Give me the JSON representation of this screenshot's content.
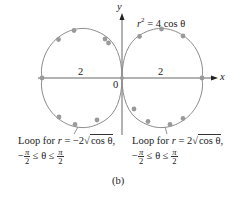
{
  "figure": {
    "caption": "(b)",
    "equation": {
      "lhs_var": "r",
      "exponent": "2",
      "rhs": "= 4 cos θ"
    },
    "axes": {
      "x_label": "x",
      "y_label": "y",
      "origin_label": "0"
    },
    "tick_labels": {
      "left": "2",
      "right": "2"
    },
    "colors": {
      "curve": "#8c8c8c",
      "points": "#9a9a9a",
      "axis": "#555555",
      "text": "#222222"
    },
    "loops": [
      {
        "name": "left",
        "label_line1": {
          "prefix": "Loop for ",
          "var": "r",
          "eq": " = −2",
          "sqrt_arg": "cos θ",
          "suffix": ","
        },
        "label_line2": {
          "neg": "−",
          "num_left": "π",
          "den_left": "2",
          "ineq": " ≤ θ ≤ ",
          "num_right": "π",
          "den_right": "2"
        }
      },
      {
        "name": "right",
        "label_line1": {
          "prefix": "Loop for ",
          "var": "r",
          "eq": " = 2",
          "sqrt_arg": "cos θ",
          "suffix": ","
        },
        "label_line2": {
          "neg": "−",
          "num_left": "π",
          "den_left": "2",
          "ineq": " ≤ θ ≤ ",
          "num_right": "π",
          "den_right": "2"
        }
      }
    ]
  }
}
